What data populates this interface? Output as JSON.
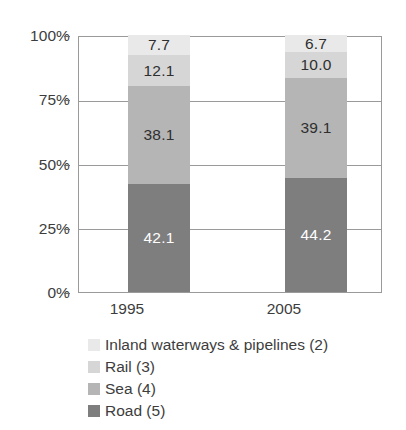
{
  "chart_data": {
    "type": "bar",
    "subtype": "stacked-100-percent",
    "title": "",
    "subtitle": "",
    "xlabel": "",
    "ylabel": "",
    "categories": [
      "1995",
      "2005"
    ],
    "ylim": [
      0,
      100
    ],
    "ytick_labels": [
      "0%",
      "25%",
      "50%",
      "75%",
      "100%"
    ],
    "ytick_values": [
      0,
      25,
      50,
      75,
      100
    ],
    "grid": true,
    "legend_position": "bottom-left",
    "stack_order_bottom_to_top": [
      "Road (5)",
      "Sea (4)",
      "Rail (3)",
      "Inland waterways & pipelines (2)"
    ],
    "series": [
      {
        "name": "Inland waterways & pipelines (2)",
        "color": "#e9e9e9",
        "label_color": "#2f2f2f",
        "values": [
          7.7,
          6.7
        ],
        "value_labels": [
          "7.7",
          "6.7"
        ]
      },
      {
        "name": "Rail (3)",
        "color": "#d6d6d6",
        "label_color": "#2f2f2f",
        "values": [
          12.1,
          10.0
        ],
        "value_labels": [
          "12.1",
          "10.0"
        ]
      },
      {
        "name": "Sea (4)",
        "color": "#b5b5b5",
        "label_color": "#2f2f2f",
        "values": [
          38.1,
          39.1
        ],
        "value_labels": [
          "38.1",
          "39.1"
        ]
      },
      {
        "name": "Road (5)",
        "color": "#7e7e7e",
        "label_color": "#ffffff",
        "values": [
          42.1,
          44.2
        ],
        "value_labels": [
          "42.1",
          "44.2"
        ]
      }
    ]
  },
  "axis": {
    "ytick_0": "0%",
    "ytick_25": "25%",
    "ytick_50": "50%",
    "ytick_75": "75%",
    "ytick_100": "100%",
    "xtick_0": "1995",
    "xtick_1": "2005"
  },
  "legend": {
    "items": [
      {
        "label": "Inland waterways & pipelines (2)",
        "color": "#e9e9e9"
      },
      {
        "label": "Rail (3)",
        "color": "#d6d6d6"
      },
      {
        "label": "Sea (4)",
        "color": "#b5b5b5"
      },
      {
        "label": "Road (5)",
        "color": "#7e7e7e"
      }
    ]
  },
  "colors": {
    "axis_line": "#9a9a9a",
    "text": "#3d3d3d",
    "background": "#ffffff"
  }
}
